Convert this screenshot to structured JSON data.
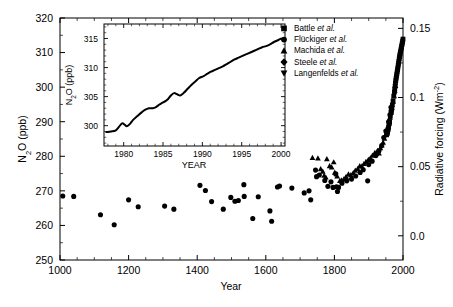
{
  "figure": {
    "name": "n2o-concentration-and-radiative-forcing",
    "background": "#ffffff",
    "marker_color": "#000000",
    "axis_color": "#000000"
  },
  "main_axes": {
    "x_title": "Year",
    "y_left_title": "N₂O (ppb)",
    "y_right_title": "Radiative forcing (Wm⁻²)",
    "x_ticks": [
      "1000",
      "1200",
      "1400",
      "1600",
      "1800",
      "2000"
    ],
    "y_left_ticks": [
      "250",
      "260",
      "270",
      "280",
      "290",
      "300",
      "310",
      "320"
    ],
    "y_right_ticks": [
      "0.0",
      "0.05",
      "0.1",
      "0.15"
    ]
  },
  "legend": {
    "entries": [
      {
        "marker": "square",
        "name": "Battle",
        "suffix": "et al."
      },
      {
        "marker": "circle",
        "name": "Flückiger",
        "suffix": "et al."
      },
      {
        "marker": "triangle-up",
        "name": "Machida",
        "suffix": "et al."
      },
      {
        "marker": "diamond",
        "name": "Steele",
        "suffix": "et al."
      },
      {
        "marker": "triangle-down",
        "name": "Langenfelds",
        "suffix": "et al."
      }
    ]
  },
  "inset_axes": {
    "x_title": "YEAR",
    "y_title": "N₂O (ppb)",
    "x_ticks": [
      "1980",
      "1985",
      "1990",
      "1995",
      "2000"
    ],
    "y_ticks": [
      "300",
      "305",
      "310",
      "315"
    ]
  },
  "chart_data": [
    {
      "type": "scatter",
      "name": "main-panel",
      "title": "",
      "xlabel": "Year",
      "ylabel": "N2O (ppb)",
      "y2label": "Radiative forcing (Wm-2)",
      "xlim": [
        1000,
        2000
      ],
      "ylim": [
        250,
        320
      ],
      "y2lim": [
        -0.0175,
        0.1575
      ],
      "xticks": [
        1000,
        1200,
        1400,
        1600,
        1800,
        2000
      ],
      "yticks": [
        250,
        260,
        270,
        280,
        290,
        300,
        310,
        320
      ],
      "y2ticks": [
        0.0,
        0.05,
        0.1,
        0.15
      ],
      "grid": false,
      "legend_position": "top-right",
      "series": [
        {
          "name": "Flückiger et al.",
          "marker": "circle",
          "points": [
            [
              1008,
              268.5
            ],
            [
              1040,
              268.4
            ],
            [
              1118,
              263.1
            ],
            [
              1158,
              260.2
            ],
            [
              1200,
              267.4
            ],
            [
              1228,
              265.4
            ],
            [
              1305,
              265.6
            ],
            [
              1332,
              264.7
            ],
            [
              1408,
              271.6
            ],
            [
              1424,
              270.1
            ],
            [
              1442,
              266.9
            ],
            [
              1476,
              264.7
            ],
            [
              1498,
              268.1
            ],
            [
              1510,
              267.0
            ],
            [
              1520,
              267.2
            ],
            [
              1536,
              271.8
            ],
            [
              1537,
              268.4
            ],
            [
              1562,
              262.0
            ],
            [
              1578,
              268.3
            ],
            [
              1612,
              264.2
            ],
            [
              1617,
              261.2
            ],
            [
              1634,
              271.1
            ],
            [
              1640,
              271.4
            ],
            [
              1676,
              270.8
            ],
            [
              1712,
              269.4
            ],
            [
              1726,
              270.0
            ],
            [
              1731,
              267.4
            ],
            [
              1745,
              276.0
            ],
            [
              1748,
              274.1
            ],
            [
              1756,
              274.6
            ],
            [
              1772,
              273.0
            ],
            [
              1781,
              271.3
            ],
            [
              1790,
              272.6
            ],
            [
              1796,
              271.0
            ],
            [
              1804,
              274.9
            ],
            [
              1806,
              271.2
            ],
            [
              1809,
              269.8
            ],
            [
              1812,
              271.0
            ],
            [
              1822,
              272.2
            ],
            [
              1836,
              272.9
            ],
            [
              1850,
              273.4
            ],
            [
              1862,
              274.3
            ],
            [
              1875,
              275.3
            ],
            [
              1884,
              276.1
            ],
            [
              1897,
              272.9
            ],
            [
              1900,
              277.6
            ],
            [
              1910,
              278.6
            ],
            [
              1921,
              280.2
            ],
            [
              1930,
              281.6
            ],
            [
              1938,
              283.1
            ],
            [
              1944,
              285.4
            ],
            [
              1950,
              287.3
            ],
            [
              1958,
              290.0
            ],
            [
              1962,
              292.0
            ],
            [
              1965,
              294.2
            ]
          ]
        },
        {
          "name": "Machida et al.",
          "marker": "triangle-up",
          "points": [
            [
              1736,
              279.6
            ],
            [
              1752,
              279.4
            ],
            [
              1760,
              276.3
            ],
            [
              1766,
              275.6
            ],
            [
              1770,
              274.4
            ],
            [
              1775,
              273.9
            ],
            [
              1778,
              279.2
            ],
            [
              1786,
              277.2
            ],
            [
              1792,
              276.8
            ],
            [
              1798,
              278.3
            ],
            [
              1801,
              275.3
            ],
            [
              1808,
              274.2
            ],
            [
              1816,
              272.9
            ],
            [
              1821,
              273.1
            ],
            [
              1828,
              273.4
            ],
            [
              1834,
              274.1
            ],
            [
              1841,
              274.8
            ],
            [
              1848,
              274.6
            ],
            [
              1855,
              275.2
            ],
            [
              1861,
              275.9
            ],
            [
              1868,
              276.4
            ],
            [
              1874,
              277.2
            ],
            [
              1880,
              277.1
            ],
            [
              1886,
              277.8
            ],
            [
              1892,
              278.4
            ],
            [
              1899,
              279.0
            ],
            [
              1905,
              279.5
            ],
            [
              1911,
              280.2
            ],
            [
              1918,
              281.0
            ],
            [
              1922,
              280.7
            ],
            [
              1926,
              281.6
            ],
            [
              1930,
              280.9
            ],
            [
              1934,
              282.4
            ],
            [
              1938,
              283.2
            ],
            [
              1942,
              284.0
            ],
            [
              1946,
              285.1
            ],
            [
              1950,
              286.3
            ],
            [
              1953,
              287.4
            ],
            [
              1956,
              288.6
            ],
            [
              1959,
              289.8
            ],
            [
              1962,
              291.2
            ],
            [
              1965,
              292.6
            ],
            [
              1968,
              294.1
            ],
            [
              1971,
              295.8
            ],
            [
              1974,
              297.4
            ],
            [
              1976,
              299.0
            ],
            [
              1978,
              300.4
            ]
          ]
        },
        {
          "name": "Battle et al.",
          "marker": "square",
          "points": [
            [
              1952,
              286.2
            ],
            [
              1955,
              287.0
            ],
            [
              1958,
              288.4
            ],
            [
              1961,
              290.0
            ],
            [
              1963,
              291.6
            ],
            [
              1965,
              292.8
            ],
            [
              1967,
              293.6
            ],
            [
              1969,
              294.8
            ],
            [
              1971,
              296.0
            ],
            [
              1973,
              297.4
            ],
            [
              1975,
              298.6
            ],
            [
              1976,
              299.5
            ],
            [
              1977,
              300.3
            ],
            [
              1978,
              301.2
            ],
            [
              1979,
              301.9
            ],
            [
              1980,
              302.6
            ],
            [
              1981,
              303.2
            ],
            [
              1982,
              303.8
            ],
            [
              1983,
              304.4
            ],
            [
              1984,
              305.0
            ],
            [
              1985,
              305.6
            ],
            [
              1986,
              306.3
            ],
            [
              1987,
              306.9
            ],
            [
              1988,
              307.5
            ],
            [
              1989,
              308.2
            ],
            [
              1990,
              308.8
            ],
            [
              1991,
              309.3
            ],
            [
              1992,
              309.8
            ],
            [
              1993,
              310.3
            ],
            [
              1994,
              310.8
            ],
            [
              1995,
              311.3
            ],
            [
              1996,
              311.8
            ],
            [
              1997,
              312.3
            ],
            [
              1998,
              312.8
            ],
            [
              1999,
              313.3
            ],
            [
              2000,
              313.9
            ],
            [
              1966,
              293.0
            ],
            [
              1960,
              289.4
            ],
            [
              1957,
              287.8
            ],
            [
              1954,
              286.6
            ]
          ]
        },
        {
          "name": "Steele et al.",
          "marker": "diamond",
          "points": []
        },
        {
          "name": "Langenfelds et al.",
          "marker": "triangle-down",
          "points": []
        }
      ]
    },
    {
      "type": "line",
      "name": "inset-panel",
      "title": "",
      "xlabel": "YEAR",
      "ylabel": "N2O (ppb)",
      "xlim": [
        1977.5,
        2000.5
      ],
      "ylim": [
        296.5,
        317.5
      ],
      "xticks": [
        1980,
        1985,
        1990,
        1995,
        2000
      ],
      "yticks": [
        300,
        305,
        310,
        315
      ],
      "grid": false,
      "x": [
        1977.8,
        1978.4,
        1979.0,
        1979.4,
        1979.8,
        1980.1,
        1980.4,
        1980.8,
        1981.2,
        1981.7,
        1982.2,
        1982.7,
        1983.2,
        1983.7,
        1984.1,
        1984.5,
        1985.0,
        1985.5,
        1986.0,
        1986.4,
        1986.8,
        1987.2,
        1987.6,
        1988.1,
        1988.6,
        1989.1,
        1989.6,
        1990.1,
        1990.6,
        1991.1,
        1991.6,
        1992.1,
        1992.6,
        1993.1,
        1993.6,
        1994.1,
        1994.6,
        1995.1,
        1995.6,
        1996.1,
        1996.6,
        1997.1,
        1997.6,
        1998.1,
        1998.6,
        1999.1,
        1999.6,
        2000.0
      ],
      "y": [
        298.9,
        299.0,
        299.2,
        299.8,
        300.4,
        300.2,
        299.9,
        300.3,
        301.0,
        301.6,
        302.2,
        302.7,
        303.0,
        303.0,
        303.2,
        303.6,
        304.0,
        304.4,
        305.2,
        305.6,
        305.4,
        305.2,
        305.6,
        306.3,
        307.0,
        307.6,
        308.2,
        308.5,
        308.9,
        309.3,
        309.6,
        309.9,
        310.2,
        310.6,
        311.0,
        311.4,
        311.7,
        312.0,
        312.3,
        312.6,
        312.9,
        313.2,
        313.5,
        313.7,
        314.0,
        314.4,
        314.7,
        315.0
      ]
    }
  ]
}
